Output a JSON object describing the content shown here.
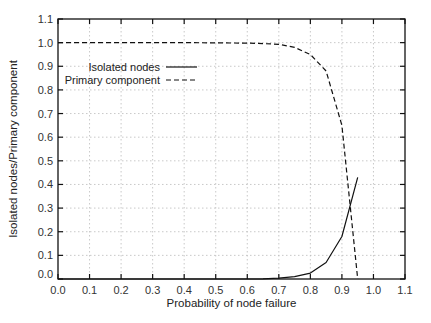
{
  "chart_data": {
    "type": "line",
    "title": "",
    "xlabel": "Probability of node failure",
    "ylabel": "Isolated nodes/Primary component",
    "xlim": [
      0.0,
      1.1
    ],
    "ylim": [
      0.0,
      1.1
    ],
    "xticks": [
      "0.0",
      "0.1",
      "0.2",
      "0.3",
      "0.4",
      "0.5",
      "0.6",
      "0.7",
      "0.8",
      "0.9",
      "1.0",
      "1.1"
    ],
    "yticks": [
      "0.0",
      "0.1",
      "0.2",
      "0.3",
      "0.4",
      "0.5",
      "0.6",
      "0.7",
      "0.8",
      "0.9",
      "1.0",
      "1.1"
    ],
    "grid": true,
    "legend_position": "upper-left-inside",
    "series": [
      {
        "name": "Isolated nodes",
        "style": "solid",
        "x": [
          0.0,
          0.1,
          0.2,
          0.3,
          0.4,
          0.5,
          0.6,
          0.65,
          0.7,
          0.75,
          0.8,
          0.85,
          0.9,
          0.95
        ],
        "y": [
          0.0,
          0.0,
          0.0,
          0.0,
          0.0,
          0.0,
          0.0,
          0.001,
          0.004,
          0.01,
          0.025,
          0.07,
          0.18,
          0.43
        ]
      },
      {
        "name": "Primary component",
        "style": "dashed",
        "x": [
          0.0,
          0.1,
          0.2,
          0.3,
          0.4,
          0.5,
          0.6,
          0.65,
          0.7,
          0.75,
          0.8,
          0.85,
          0.9,
          0.95
        ],
        "y": [
          1.0,
          1.0,
          1.0,
          1.0,
          1.0,
          0.999,
          0.998,
          0.996,
          0.993,
          0.98,
          0.95,
          0.88,
          0.65,
          0.0
        ]
      }
    ]
  },
  "legend": {
    "items": [
      {
        "label": "Isolated nodes"
      },
      {
        "label": "Primary component"
      }
    ]
  }
}
